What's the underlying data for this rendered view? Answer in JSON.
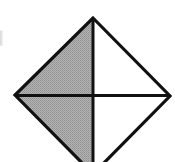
{
  "diagram": {
    "type": "diamond-quadrants",
    "vertices": {
      "top": [
        93,
        18
      ],
      "left": [
        15,
        95
      ],
      "right": [
        170,
        96
      ],
      "bottom": [
        93,
        174
      ]
    },
    "center": [
      93,
      95
    ],
    "colors": {
      "stroke": "#111111",
      "shaded_fill": "#a8a8a8",
      "unshaded_fill": "#ffffff",
      "background": "#ffffff"
    },
    "quadrants": [
      {
        "position": "upper-left",
        "shaded": true
      },
      {
        "position": "lower-left",
        "shaded": true
      },
      {
        "position": "upper-right",
        "shaded": false
      },
      {
        "position": "lower-right",
        "shaded": false
      }
    ],
    "stroke_width": 3
  }
}
